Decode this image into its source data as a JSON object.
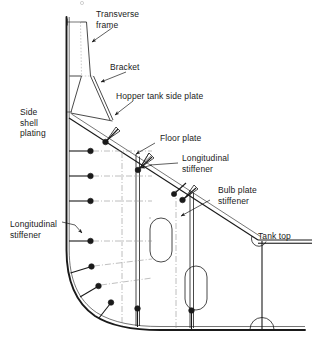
{
  "figure": {
    "ink_color": "#1a1a1a",
    "background": "#ffffff",
    "width": 315,
    "height": 337
  },
  "labels": {
    "transverse_frame": "Transverse\nframe",
    "bracket": "Bracket",
    "hopper_tank_side_plate": "Hopper tank side plate",
    "side_shell_plating": "Side\nshell\nplating",
    "floor_plate": "Floor plate",
    "longitudinal_stiffener_upper": "Longitudinal\nstiffener",
    "bulb_plate_stiffener": "Bulb plate\nstiffener",
    "longitudinal_stiffener_left": "Longitudinal\nstiffener",
    "tank_top": "Tank top"
  },
  "components": {
    "side_shell_plating": "side-shell-plating",
    "hopper_tank_side_plate": "hopper-tank-side-plate",
    "tank_top_plate": "tank-top-plate",
    "bottom_shell_plating": "bottom-shell-plating",
    "transverse_frame": "transverse-frame",
    "bracket": "bracket",
    "floor_plates": "floor-plates",
    "lightening_holes": 2,
    "shell_longitudinals": 9,
    "bottom_longitudinals": 2,
    "hopper_longitudinals": 3
  }
}
